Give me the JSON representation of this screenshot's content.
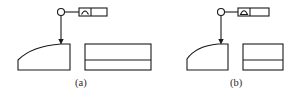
{
  "figure": {
    "type": "engineering-drawing-gdt",
    "panels": [
      {
        "id": "a",
        "caption": "(a)",
        "datum_symbol": "circle",
        "tolerance_frame": {
          "symbol": "profile-of-a-line",
          "symbol_glyph": "arc",
          "cells": 2,
          "value": ""
        },
        "leader": "arrow-to-curved-surface",
        "views": [
          "front-view-curved-top",
          "side-view-rectangle-with-line"
        ]
      },
      {
        "id": "b",
        "caption": "(b)",
        "datum_symbol": "circle",
        "tolerance_frame": {
          "symbol": "profile-of-a-surface",
          "symbol_glyph": "filled-semicircle",
          "cells": 2,
          "value": ""
        },
        "leader": "arrow-to-curved-surface",
        "views": [
          "front-view-curved-top",
          "side-view-rectangle-with-line"
        ]
      }
    ],
    "colors": {
      "line": "#1a1a1a",
      "background": "#ffffff",
      "text": "#2a2a2a"
    }
  }
}
